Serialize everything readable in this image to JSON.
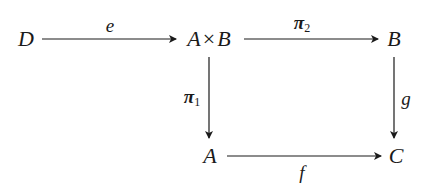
{
  "diagram": {
    "type": "commutative-diagram",
    "nodes": {
      "D": {
        "label": "D"
      },
      "AxB": {
        "left": "A",
        "op": "×",
        "right": "B"
      },
      "B": {
        "label": "B"
      },
      "A": {
        "label": "A"
      },
      "C": {
        "label": "C"
      }
    },
    "edges": {
      "e": {
        "from": "D",
        "to": "A×B",
        "label": "e"
      },
      "pi2": {
        "from": "A×B",
        "to": "B",
        "base": "π",
        "sub": "2"
      },
      "pi1": {
        "from": "A×B",
        "to": "A",
        "base": "π",
        "sub": "1"
      },
      "g": {
        "from": "B",
        "to": "C",
        "label": "g"
      },
      "f": {
        "from": "A",
        "to": "C",
        "label": "f"
      }
    },
    "colors": {
      "ink": "#1a1a1a",
      "background": "#ffffff"
    }
  }
}
